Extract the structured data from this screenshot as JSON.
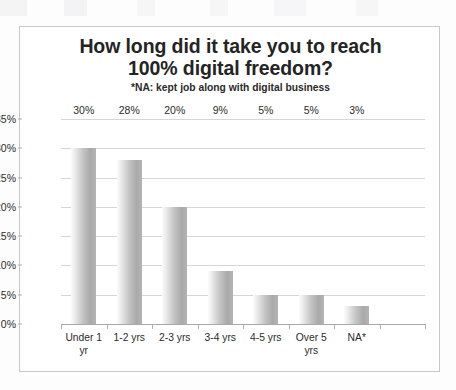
{
  "chart_data": {
    "type": "bar",
    "title": "How long did it take you to reach 100% digital freedom?",
    "title_line1": "How long did it take you to reach",
    "title_line2": "100% digital freedom?",
    "subtitle": "*NA: kept job along with digital business",
    "xlabel": "",
    "ylabel": "",
    "ylim": [
      0,
      35
    ],
    "ytick_labels": [
      "0%",
      "5%",
      "10%",
      "15%",
      "20%",
      "25%",
      "30%",
      "35%"
    ],
    "ytick_values": [
      0,
      5,
      10,
      15,
      20,
      25,
      30,
      35
    ],
    "grid": true,
    "legend": false,
    "categories": [
      "Under 1 yr",
      "1-2 yrs",
      "2-3 yrs",
      "3-4 yrs",
      "4-5 yrs",
      "Over 5 yrs",
      "NA*"
    ],
    "values": [
      30,
      28,
      20,
      9,
      5,
      5,
      3
    ],
    "data_labels": [
      "30%",
      "28%",
      "20%",
      "9%",
      "5%",
      "5%",
      "3%"
    ],
    "bar_color_light": "#fbfbfb",
    "bar_color_dark": "#a9a9aa",
    "grid_color": "#d6d6d8",
    "text_color": "#2b2b2b",
    "empty_trailing_slot": true
  }
}
